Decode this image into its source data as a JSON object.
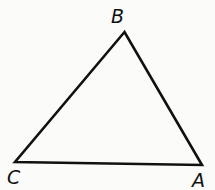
{
  "diagram": {
    "type": "triangle",
    "stroke_color": "#111111",
    "vertices": [
      {
        "name": "B",
        "x": 124.5,
        "y": 32,
        "label_x": 111,
        "label_y": 23
      },
      {
        "name": "C",
        "x": 15,
        "y": 162,
        "label_x": 7,
        "label_y": 184
      },
      {
        "name": "A",
        "x": 202,
        "y": 165,
        "label_x": 192,
        "label_y": 187
      }
    ]
  }
}
